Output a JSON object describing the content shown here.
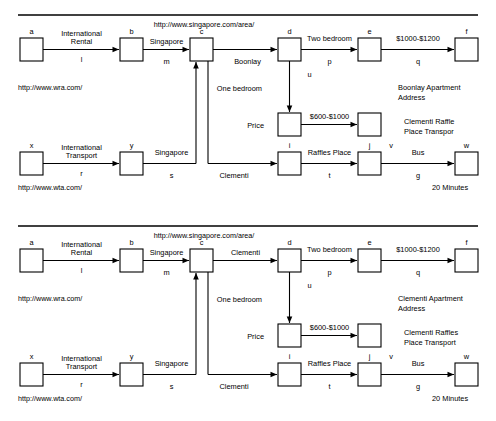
{
  "diagram": {
    "title_rule": true,
    "panels": [
      {
        "id": "top",
        "url_header": "http://www.singapore.com/area/",
        "nodes": [
          {
            "id": "a",
            "label": "a"
          },
          {
            "id": "b",
            "label": "b"
          },
          {
            "id": "c",
            "label": "c"
          },
          {
            "id": "d",
            "label": "d"
          },
          {
            "id": "e",
            "label": "e"
          },
          {
            "id": "f",
            "label": "f"
          },
          {
            "id": "price_src",
            "label": ""
          },
          {
            "id": "price_dst",
            "label": ""
          },
          {
            "id": "x",
            "label": "x"
          },
          {
            "id": "y",
            "label": "y"
          },
          {
            "id": "i",
            "label": "i"
          },
          {
            "id": "j",
            "label": "j"
          },
          {
            "id": "w",
            "label": "w"
          }
        ],
        "edges": [
          {
            "from": "a",
            "to": "b",
            "top": "International Rental",
            "bottom": "l"
          },
          {
            "from": "b",
            "to": "c",
            "top": "Singapore",
            "bottom": "m"
          },
          {
            "from": "c",
            "to": "d",
            "top": "",
            "bottom": "Boonlay"
          },
          {
            "from": "d",
            "to": "e",
            "top": "Two bedroom",
            "bottom": "p"
          },
          {
            "from": "e",
            "to": "f",
            "top": "$1000-$1200",
            "bottom": "q"
          },
          {
            "from": "d",
            "to": "price_src",
            "top": "u",
            "bottom": "Price"
          },
          {
            "from": "price_src",
            "to": "price_dst",
            "top": "$600-$1000",
            "bottom": ""
          },
          {
            "from": "x",
            "to": "y",
            "top": "International Transport",
            "bottom": "r"
          },
          {
            "from": "y",
            "to": "c",
            "top": "Singapore",
            "bottom": "s"
          },
          {
            "from": "c",
            "to": "i",
            "top": "",
            "bottom": "Clementi"
          },
          {
            "from": "i",
            "to": "j",
            "top": "Raffles Place",
            "bottom": "t"
          },
          {
            "from": "j",
            "to": "w",
            "top": "Bus",
            "bottom": "g"
          }
        ],
        "labels": {
          "one_bedroom": "One bedroom",
          "v_marker": "v"
        },
        "notes": [
          {
            "id": "url_wra",
            "text": "http://www.wra.com/"
          },
          {
            "id": "url_wta",
            "text": "http://www.wta.com/"
          },
          {
            "id": "apartment_address_1",
            "text": "Boonlay Apartment"
          },
          {
            "id": "apartment_address_2",
            "text": "Address"
          },
          {
            "id": "transport_1",
            "text": "Clementi Raffle"
          },
          {
            "id": "transport_2",
            "text": "Place Transpor"
          },
          {
            "id": "duration",
            "text": "20 Minutes"
          }
        ]
      },
      {
        "id": "bottom",
        "url_header": "http://www.singapore.com/area/",
        "nodes": [
          {
            "id": "a",
            "label": "a"
          },
          {
            "id": "b",
            "label": "b"
          },
          {
            "id": "c",
            "label": "c"
          },
          {
            "id": "d",
            "label": "d"
          },
          {
            "id": "e",
            "label": "e"
          },
          {
            "id": "f",
            "label": "f"
          },
          {
            "id": "price_src",
            "label": ""
          },
          {
            "id": "price_dst",
            "label": ""
          },
          {
            "id": "x",
            "label": "x"
          },
          {
            "id": "y",
            "label": "y"
          },
          {
            "id": "i",
            "label": "i"
          },
          {
            "id": "j",
            "label": "j"
          },
          {
            "id": "w",
            "label": "w"
          }
        ],
        "edges": [
          {
            "from": "a",
            "to": "b",
            "top": "International Rental",
            "bottom": "l"
          },
          {
            "from": "b",
            "to": "c",
            "top": "Singapore",
            "bottom": "m"
          },
          {
            "from": "c",
            "to": "d",
            "top": "Clementi",
            "bottom": ""
          },
          {
            "from": "d",
            "to": "e",
            "top": "Two bedroom",
            "bottom": "p"
          },
          {
            "from": "e",
            "to": "f",
            "top": "$1000-$1200",
            "bottom": "q"
          },
          {
            "from": "d",
            "to": "price_src",
            "top": "u",
            "bottom": "Price"
          },
          {
            "from": "price_src",
            "to": "price_dst",
            "top": "$600-$1000",
            "bottom": ""
          },
          {
            "from": "x",
            "to": "y",
            "top": "International Transport",
            "bottom": "r"
          },
          {
            "from": "y",
            "to": "c",
            "top": "Singapore",
            "bottom": "s"
          },
          {
            "from": "c",
            "to": "i",
            "top": "",
            "bottom": "Clementi"
          },
          {
            "from": "i",
            "to": "j",
            "top": "Raffles Place",
            "bottom": "t"
          },
          {
            "from": "j",
            "to": "w",
            "top": "Bus",
            "bottom": "g"
          }
        ],
        "labels": {
          "one_bedroom": "One bedroom",
          "v_marker": "v"
        },
        "notes": [
          {
            "id": "url_wra",
            "text": "http://www.wra.com/"
          },
          {
            "id": "url_wta",
            "text": "http://www.wta.com/"
          },
          {
            "id": "apartment_address_1",
            "text": "Clementi Apartment"
          },
          {
            "id": "apartment_address_2",
            "text": "Address"
          },
          {
            "id": "transport_1",
            "text": "Clementi Raffles"
          },
          {
            "id": "transport_2",
            "text": "Place Transport"
          },
          {
            "id": "duration",
            "text": "20 Minutes"
          }
        ]
      }
    ]
  }
}
